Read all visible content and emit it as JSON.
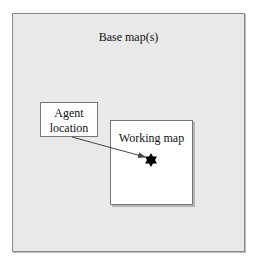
{
  "base_map": {
    "label": "Base map(s)",
    "fill": "#e9e9e9"
  },
  "agent_box": {
    "line1": "Agent",
    "line2": "location"
  },
  "working_map": {
    "label": "Working map"
  },
  "marker": {
    "icon": "six-pointed-star-icon",
    "color": "#000000"
  },
  "arrow": {
    "from": "agent_box",
    "to": "marker",
    "color": "#444444"
  }
}
